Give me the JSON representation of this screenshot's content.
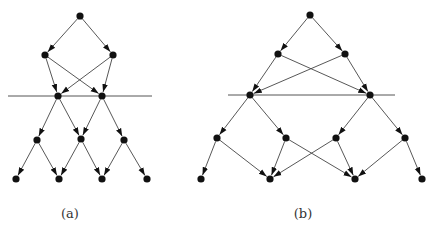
{
  "figures": [
    {
      "id": "a",
      "caption": "(a)",
      "caption_pos": [
        70,
        218
      ],
      "cut_line": [
        8,
        96,
        152,
        96
      ],
      "nodes": [
        [
          80,
          16
        ],
        [
          45,
          55
        ],
        [
          113,
          55
        ],
        [
          58,
          96
        ],
        [
          102,
          96
        ],
        [
          37,
          140
        ],
        [
          81,
          139
        ],
        [
          124,
          140
        ],
        [
          16,
          179
        ],
        [
          59,
          179
        ],
        [
          102,
          179
        ],
        [
          147,
          179
        ]
      ],
      "edges": [
        [
          0,
          1
        ],
        [
          0,
          2
        ],
        [
          1,
          3
        ],
        [
          1,
          4
        ],
        [
          2,
          3
        ],
        [
          2,
          4
        ],
        [
          3,
          5
        ],
        [
          3,
          6
        ],
        [
          4,
          6
        ],
        [
          4,
          7
        ],
        [
          5,
          8
        ],
        [
          5,
          9
        ],
        [
          6,
          9
        ],
        [
          6,
          10
        ],
        [
          7,
          10
        ],
        [
          7,
          11
        ]
      ]
    },
    {
      "id": "b",
      "caption": "(b)",
      "caption_pos": [
        303,
        218
      ],
      "cut_line": [
        228,
        95,
        395,
        95
      ],
      "nodes": [
        [
          310,
          15
        ],
        [
          278,
          54
        ],
        [
          345,
          54
        ],
        [
          250,
          95
        ],
        [
          370,
          95
        ],
        [
          217,
          138
        ],
        [
          286,
          138
        ],
        [
          336,
          138
        ],
        [
          405,
          138
        ],
        [
          201,
          179
        ],
        [
          270,
          179
        ],
        [
          355,
          179
        ],
        [
          422,
          179
        ]
      ],
      "edges": [
        [
          0,
          1
        ],
        [
          0,
          2
        ],
        [
          1,
          3
        ],
        [
          1,
          4
        ],
        [
          2,
          3
        ],
        [
          2,
          4
        ],
        [
          3,
          5
        ],
        [
          3,
          6
        ],
        [
          4,
          7
        ],
        [
          4,
          8
        ],
        [
          5,
          9
        ],
        [
          5,
          10
        ],
        [
          6,
          10
        ],
        [
          6,
          11
        ],
        [
          7,
          10
        ],
        [
          7,
          11
        ],
        [
          8,
          11
        ],
        [
          8,
          12
        ]
      ]
    }
  ],
  "style": {
    "node_radius": 3.6,
    "node_color": "#111111",
    "edge_color": "#444444"
  }
}
